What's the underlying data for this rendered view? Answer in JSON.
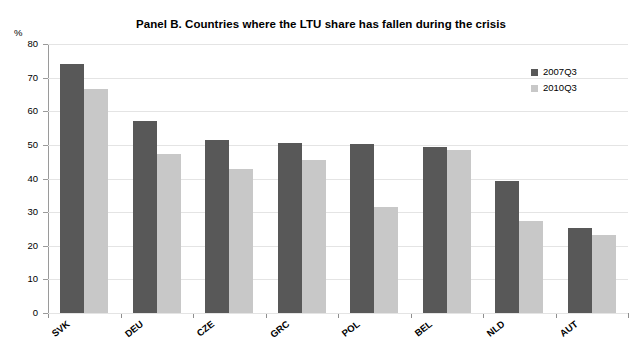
{
  "chart_data": {
    "type": "bar",
    "title": "Panel B. Countries where the LTU share has fallen during the crisis",
    "xlabel": "",
    "ylabel": "%",
    "ylim": [
      0,
      80
    ],
    "yticks": [
      0,
      10,
      20,
      30,
      40,
      50,
      60,
      70,
      80
    ],
    "grid": true,
    "legend_position": "top-right",
    "categories": [
      "SVK",
      "DEU",
      "CZE",
      "GRC",
      "POL",
      "BEL",
      "NLD",
      "AUT"
    ],
    "series": [
      {
        "name": "2007Q3",
        "color": "#585858",
        "values": [
          74.0,
          57.2,
          51.6,
          50.7,
          50.3,
          49.3,
          39.4,
          25.4
        ]
      },
      {
        "name": "2010Q3",
        "color": "#c8c8c8",
        "values": [
          66.5,
          47.3,
          42.8,
          45.6,
          31.6,
          48.4,
          27.3,
          23.2
        ]
      }
    ]
  },
  "legend": {
    "items": [
      {
        "label": "2007Q3"
      },
      {
        "label": "2010Q3"
      }
    ]
  },
  "axis": {
    "unit": "%"
  }
}
